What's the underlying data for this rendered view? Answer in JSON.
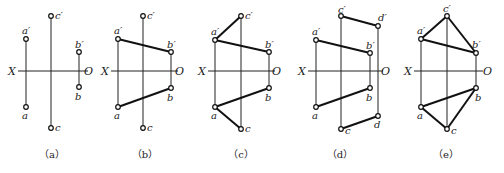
{
  "figure": {
    "axis_labels": {
      "left": "X",
      "right": "O"
    },
    "panels": [
      {
        "id": "a",
        "caption": "（a）",
        "x_axis": {
          "y": 71,
          "x1": 18,
          "x2": 88,
          "lx": 8,
          "rx": 84
        },
        "projectors": [
          [
            26,
            39,
            26,
            107
          ],
          [
            51,
            16,
            51,
            128
          ],
          [
            79,
            52,
            79,
            87
          ]
        ],
        "edges": [],
        "points": [
          {
            "label": "a′",
            "x": 26,
            "y": 39,
            "lx": 22,
            "ly": 34
          },
          {
            "label": "a",
            "x": 26,
            "y": 107,
            "lx": 22,
            "ly": 119
          },
          {
            "label": "c′",
            "x": 51,
            "y": 16,
            "lx": 55,
            "ly": 19
          },
          {
            "label": "c",
            "x": 51,
            "y": 128,
            "lx": 55,
            "ly": 131
          },
          {
            "label": "b′",
            "x": 79,
            "y": 52,
            "lx": 75,
            "ly": 48
          },
          {
            "label": "b",
            "x": 79,
            "y": 87,
            "lx": 75,
            "ly": 100
          }
        ],
        "caption_x": 52
      },
      {
        "id": "b",
        "caption": "（b）",
        "x_axis": {
          "y": 71,
          "x1": 111,
          "x2": 178,
          "lx": 101,
          "rx": 175
        },
        "projectors": [
          [
            118,
            39,
            118,
            107
          ],
          [
            143,
            16,
            143,
            128
          ],
          [
            171,
            52,
            171,
            88
          ]
        ],
        "edges": [
          [
            118,
            39,
            171,
            52
          ],
          [
            118,
            107,
            171,
            88
          ]
        ],
        "points": [
          {
            "label": "a′",
            "x": 118,
            "y": 39,
            "lx": 114,
            "ly": 34
          },
          {
            "label": "a",
            "x": 118,
            "y": 107,
            "lx": 114,
            "ly": 119
          },
          {
            "label": "c′",
            "x": 143,
            "y": 16,
            "lx": 147,
            "ly": 19
          },
          {
            "label": "c",
            "x": 143,
            "y": 128,
            "lx": 147,
            "ly": 131
          },
          {
            "label": "b′",
            "x": 171,
            "y": 52,
            "lx": 167,
            "ly": 48
          },
          {
            "label": "b",
            "x": 171,
            "y": 88,
            "lx": 167,
            "ly": 101
          }
        ],
        "caption_x": 145
      },
      {
        "id": "c",
        "caption": "（c）",
        "x_axis": {
          "y": 71,
          "x1": 208,
          "x2": 275,
          "lx": 198,
          "rx": 272
        },
        "projectors": [
          [
            215,
            40,
            215,
            107
          ],
          [
            241,
            16,
            241,
            129
          ],
          [
            269,
            52,
            269,
            88
          ]
        ],
        "edges": [
          [
            215,
            40,
            269,
            52
          ],
          [
            215,
            107,
            269,
            88
          ],
          [
            215,
            40,
            241,
            16
          ],
          [
            215,
            107,
            241,
            129
          ]
        ],
        "points": [
          {
            "label": "a′",
            "x": 215,
            "y": 40,
            "lx": 211,
            "ly": 35
          },
          {
            "label": "a",
            "x": 215,
            "y": 107,
            "lx": 211,
            "ly": 119
          },
          {
            "label": "c′",
            "x": 241,
            "y": 16,
            "lx": 245,
            "ly": 19
          },
          {
            "label": "c",
            "x": 241,
            "y": 129,
            "lx": 245,
            "ly": 132
          },
          {
            "label": "b′",
            "x": 269,
            "y": 52,
            "lx": 265,
            "ly": 48
          },
          {
            "label": "b",
            "x": 269,
            "y": 88,
            "lx": 265,
            "ly": 101
          }
        ],
        "caption_x": 241
      },
      {
        "id": "d",
        "caption": "（d）",
        "x_axis": {
          "y": 71,
          "x1": 308,
          "x2": 383,
          "lx": 298,
          "rx": 381
        },
        "projectors": [
          [
            316,
            40,
            316,
            107
          ],
          [
            341,
            16,
            341,
            129
          ],
          [
            370,
            53,
            370,
            88
          ],
          [
            378,
            26,
            378,
            116
          ]
        ],
        "edges": [
          [
            316,
            40,
            370,
            53
          ],
          [
            316,
            107,
            370,
            88
          ],
          [
            341,
            16,
            378,
            26
          ],
          [
            341,
            129,
            378,
            116
          ]
        ],
        "points": [
          {
            "label": "a′",
            "x": 316,
            "y": 40,
            "lx": 312,
            "ly": 35
          },
          {
            "label": "a",
            "x": 316,
            "y": 107,
            "lx": 312,
            "ly": 119
          },
          {
            "label": "c′",
            "x": 341,
            "y": 16,
            "lx": 338,
            "ly": 13
          },
          {
            "label": "c",
            "x": 341,
            "y": 129,
            "lx": 345,
            "ly": 134
          },
          {
            "label": "b′",
            "x": 370,
            "y": 53,
            "lx": 366,
            "ly": 49
          },
          {
            "label": "b",
            "x": 370,
            "y": 88,
            "lx": 366,
            "ly": 101
          },
          {
            "label": "d′",
            "x": 378,
            "y": 26,
            "lx": 378,
            "ly": 21
          },
          {
            "label": "d",
            "x": 378,
            "y": 116,
            "lx": 374,
            "ly": 128
          }
        ],
        "caption_x": 340
      },
      {
        "id": "e",
        "caption": "（e）",
        "x_axis": {
          "y": 71,
          "x1": 414,
          "x2": 483,
          "lx": 404,
          "rx": 483
        },
        "projectors": [
          [
            421,
            39,
            421,
            107
          ],
          [
            447,
            16,
            447,
            129
          ],
          [
            476,
            53,
            476,
            88
          ]
        ],
        "edges": [
          [
            421,
            39,
            476,
            53
          ],
          [
            421,
            107,
            476,
            88
          ],
          [
            421,
            39,
            447,
            16
          ],
          [
            447,
            16,
            476,
            53
          ],
          [
            421,
            107,
            447,
            129
          ],
          [
            447,
            129,
            476,
            88
          ]
        ],
        "points": [
          {
            "label": "a′",
            "x": 421,
            "y": 39,
            "lx": 417,
            "ly": 34
          },
          {
            "label": "a",
            "x": 421,
            "y": 107,
            "lx": 417,
            "ly": 119
          },
          {
            "label": "c′",
            "x": 447,
            "y": 16,
            "lx": 443,
            "ly": 12
          },
          {
            "label": "c",
            "x": 447,
            "y": 129,
            "lx": 451,
            "ly": 134
          },
          {
            "label": "b′",
            "x": 476,
            "y": 53,
            "lx": 472,
            "ly": 48
          },
          {
            "label": "b",
            "x": 476,
            "y": 88,
            "lx": 475,
            "ly": 101
          }
        ],
        "caption_x": 446
      }
    ],
    "caption_y": 158
  }
}
